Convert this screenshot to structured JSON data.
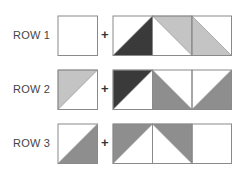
{
  "colors": {
    "dark": "#3a3a3a",
    "mid": "#8e8e8e",
    "light": "#c4c4c4",
    "stroke": "#8a8a8a",
    "background": "#ffffff"
  },
  "rows": [
    {
      "label": "ROW 1",
      "operator": "+",
      "single": {
        "fill": "none",
        "triangle": null
      },
      "strip": [
        {
          "fill": "dark",
          "triangle": "lower-right"
        },
        {
          "fill": "light",
          "triangle": "upper-right"
        },
        {
          "fill": "light",
          "triangle": "lower-left"
        }
      ]
    },
    {
      "label": "ROW 2",
      "operator": "+",
      "single": {
        "fill": "light",
        "triangle": "upper-left"
      },
      "strip": [
        {
          "fill": "dark",
          "triangle": "upper-left"
        },
        {
          "fill": "mid",
          "triangle": "lower-left"
        },
        {
          "fill": "mid",
          "triangle": "lower-right"
        }
      ]
    },
    {
      "label": "ROW 3",
      "operator": "+",
      "single": {
        "fill": "mid",
        "triangle": "lower-right"
      },
      "strip": [
        {
          "fill": "mid",
          "triangle": "upper-left"
        },
        {
          "fill": "mid",
          "triangle": "upper-right"
        },
        {
          "fill": "none",
          "triangle": null
        }
      ]
    }
  ]
}
